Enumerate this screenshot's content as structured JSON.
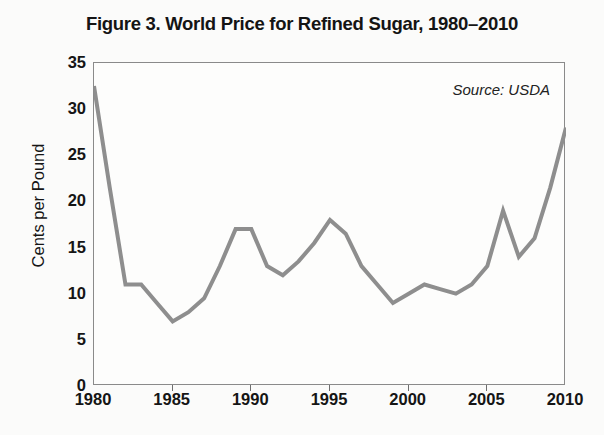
{
  "figure": {
    "title": "Figure 3. World Price for Refined Sugar, 1980–2010",
    "source_note": "Source: USDA"
  },
  "chart_data": {
    "type": "line",
    "title": "Figure 3. World Price for Refined Sugar, 1980–2010",
    "subtitle": "",
    "xlabel": "",
    "ylabel": "Cents per Pound",
    "annotations": [
      "Source: USDA"
    ],
    "grid": false,
    "legend": "none",
    "line_color": "#8e8e8e",
    "xlim": [
      1980,
      2010
    ],
    "ylim": [
      0,
      35
    ],
    "xticks": [
      1980,
      1985,
      1990,
      1995,
      2000,
      2005,
      2010
    ],
    "xtick_labels": [
      "1980",
      "1985",
      "1990",
      "1995",
      "2000",
      "2005",
      "2010"
    ],
    "yticks": [
      0,
      5,
      10,
      15,
      20,
      25,
      30,
      35
    ],
    "ytick_labels": [
      "0",
      "5",
      "10",
      "15",
      "20",
      "25",
      "30",
      "35"
    ],
    "x": [
      1980,
      1981,
      1982,
      1983,
      1984,
      1985,
      1986,
      1987,
      1988,
      1989,
      1990,
      1991,
      1992,
      1993,
      1994,
      1995,
      1996,
      1997,
      1998,
      1999,
      2000,
      2001,
      2002,
      2003,
      2004,
      2005,
      2006,
      2007,
      2008,
      2009,
      2010
    ],
    "series": [
      {
        "name": "World price for refined sugar",
        "units": "cents per pound",
        "values": [
          32.5,
          21.5,
          11.0,
          11.0,
          9.0,
          7.0,
          8.0,
          9.5,
          13.0,
          17.0,
          17.0,
          13.0,
          12.0,
          13.5,
          15.5,
          18.0,
          16.5,
          13.0,
          11.0,
          9.0,
          10.0,
          11.0,
          10.5,
          10.0,
          11.0,
          13.0,
          19.0,
          14.0,
          16.0,
          21.5,
          28.0
        ]
      }
    ]
  }
}
